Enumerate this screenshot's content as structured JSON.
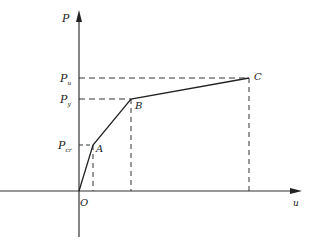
{
  "diagram": {
    "type": "load-displacement curve",
    "axes": {
      "y_label": "P",
      "x_label": "u",
      "origin_label": "O"
    },
    "points": [
      {
        "name": "A",
        "label": "A",
        "x": 93,
        "y": 145
      },
      {
        "name": "B",
        "label": "B",
        "x": 131,
        "y": 99
      },
      {
        "name": "C",
        "label": "C",
        "x": 249,
        "y": 78
      }
    ],
    "levels": [
      {
        "label_main": "P",
        "label_sub": "u",
        "y": 78
      },
      {
        "label_main": "P",
        "label_sub": "y",
        "y": 99
      },
      {
        "label_main": "P",
        "label_sub": "cr",
        "y": 145
      }
    ],
    "colors": {
      "line": "#333333",
      "dash": "#333333",
      "text": "#222222"
    }
  }
}
